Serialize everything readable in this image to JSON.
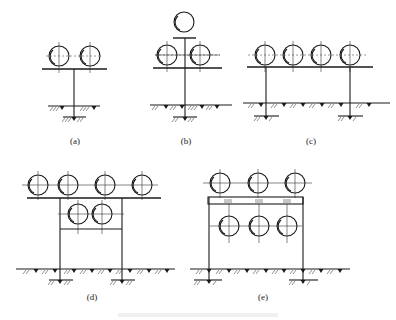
{
  "figure": {
    "panels": [
      {
        "id": "a",
        "label": "(a)",
        "description": "single post support with two pipes on a crossbeam"
      },
      {
        "id": "b",
        "label": "(b)",
        "description": "single post support with two pipes on a crossbeam and one pipe on top"
      },
      {
        "id": "c",
        "label": "(c)",
        "description": "two post support with four pipes on a crossbeam"
      },
      {
        "id": "d",
        "label": "(d)",
        "description": "two post frame with four pipes on top and two pipes on lower tier"
      },
      {
        "id": "e",
        "label": "(e)",
        "description": "two post frame with three pipes on top and three hanging pipes below"
      }
    ],
    "caption": ""
  }
}
